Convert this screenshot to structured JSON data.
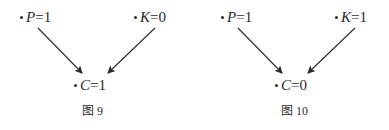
{
  "figures": [
    {
      "caption": "图 9",
      "nodes": {
        "p": {
          "var": "P",
          "eq": "=1"
        },
        "k": {
          "var": "K",
          "eq": "=0"
        },
        "c": {
          "var": "C",
          "eq": "=1"
        }
      },
      "edges": [
        {
          "from": "P",
          "to": "C"
        },
        {
          "from": "K",
          "to": "C"
        }
      ]
    },
    {
      "caption": "图 10",
      "nodes": {
        "p": {
          "var": "P",
          "eq": "=1"
        },
        "k": {
          "var": "K",
          "eq": "=1"
        },
        "c": {
          "var": "C",
          "eq": "=0"
        }
      },
      "edges": [
        {
          "from": "P",
          "to": "C"
        },
        {
          "from": "K",
          "to": "C"
        }
      ]
    }
  ],
  "colors": {
    "ink": "#2a2a2a",
    "background": "#ffffff"
  }
}
